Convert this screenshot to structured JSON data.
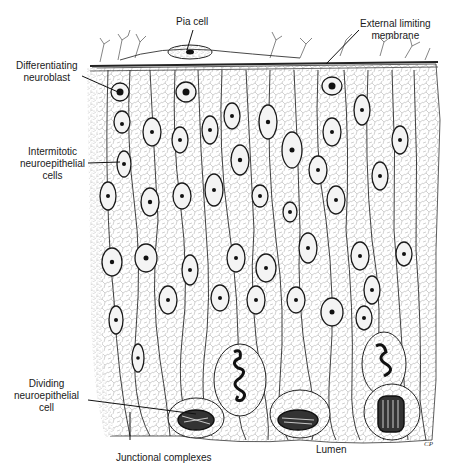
{
  "figure": {
    "signature": "CP",
    "colors": {
      "ink": "#1a1a1a",
      "paper": "#ffffff",
      "stipple": "#555555"
    }
  },
  "labels": {
    "pia_cell": "Pia cell",
    "external_limiting_membrane_1": "External limiting",
    "external_limiting_membrane_2": "membrane",
    "differentiating_neuroblast_1": "Differentiating",
    "differentiating_neuroblast_2": "neuroblast",
    "intermitotic_1": "Intermitotic",
    "intermitotic_2": "neuroepithelial",
    "intermitotic_3": "cells",
    "dividing_1": "Dividing",
    "dividing_2": "neuroepithelial",
    "dividing_3": "cell",
    "junctional_complexes": "Junctional complexes",
    "lumen": "Lumen"
  }
}
